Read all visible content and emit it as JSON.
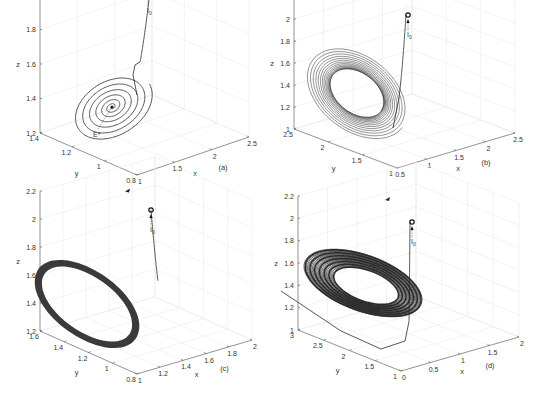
{
  "chart_data": [
    {
      "type": "line",
      "panel_label": "(a)",
      "title": "",
      "xlabel": "x",
      "ylabel": "y",
      "zlabel": "z",
      "xlim": [
        1,
        2.5
      ],
      "ylim": [
        0.8,
        1.4
      ],
      "zlim": [
        1.2,
        2.0
      ],
      "xticks": [
        "1",
        "1.5",
        "2",
        "2.5"
      ],
      "yticks": [
        "0.8",
        "1",
        "1.2",
        "1.4"
      ],
      "zticks": [
        "1.2",
        "1.4",
        "1.6",
        "1.8",
        "2"
      ],
      "grid": true,
      "behavior": "stable-focus spiral converging to equilibrium",
      "initial_point": {
        "label": "I",
        "subscript": "0",
        "x": 2.5,
        "y": 1.4,
        "z": 2.0
      },
      "equilibrium": {
        "label": "E*",
        "x": 1.5,
        "y": 1.1,
        "z": 1.45
      }
    },
    {
      "type": "line",
      "panel_label": "(b)",
      "title": "",
      "xlabel": "x",
      "ylabel": "y",
      "zlabel": "z",
      "xlim": [
        0.5,
        2.5
      ],
      "ylim": [
        1,
        2.5
      ],
      "zlim": [
        1,
        2.2
      ],
      "xticks": [
        "0.5",
        "1",
        "1.5",
        "2",
        "2.5"
      ],
      "yticks": [
        "1",
        "1.5",
        "2",
        "2.5"
      ],
      "zticks": [
        "1",
        "1.2",
        "1.4",
        "1.6",
        "1.8",
        "2",
        "2.2"
      ],
      "grid": true,
      "behavior": "trajectory converging to a limit cycle",
      "initial_point": {
        "label": "I",
        "subscript": "0",
        "x": 2.5,
        "y": 2.5,
        "z": 1.8
      }
    },
    {
      "type": "line",
      "panel_label": "(c)",
      "title": "",
      "xlabel": "x",
      "ylabel": "y",
      "zlabel": "z",
      "xlim": [
        1,
        2
      ],
      "ylim": [
        0.8,
        1.6
      ],
      "zlim": [
        1.2,
        2.2
      ],
      "xticks": [
        "1",
        "1.2",
        "1.4",
        "1.6",
        "1.8",
        "2"
      ],
      "yticks": [
        "0.8",
        "1",
        "1.2",
        "1.4",
        "1.6"
      ],
      "zticks": [
        "1.2",
        "1.4",
        "1.6",
        "1.8",
        "2",
        "2.2"
      ],
      "grid": true,
      "behavior": "stable periodic orbit (thick limit cycle)",
      "initial_point": {
        "label": "I",
        "subscript": "0",
        "x": 2.0,
        "y": 1.6,
        "z": 2.0
      }
    },
    {
      "type": "line",
      "panel_label": "(d)",
      "title": "",
      "xlabel": "x",
      "ylabel": "y",
      "zlabel": "z",
      "xlim": [
        0,
        2
      ],
      "ylim": [
        1,
        3
      ],
      "zlim": [
        1,
        2.2
      ],
      "xticks": [
        "0",
        "0.5",
        "1",
        "1.5",
        "2"
      ],
      "yticks": [
        "1",
        "1.5",
        "2",
        "2.5",
        "3"
      ],
      "zticks": [
        "1",
        "1.2",
        "1.4",
        "1.6",
        "1.8",
        "2",
        "2.2"
      ],
      "grid": true,
      "behavior": "chaotic attractor",
      "initial_point": {
        "label": "I",
        "subscript": "0",
        "x": 2.0,
        "y": 3.0,
        "z": 1.8
      }
    }
  ]
}
